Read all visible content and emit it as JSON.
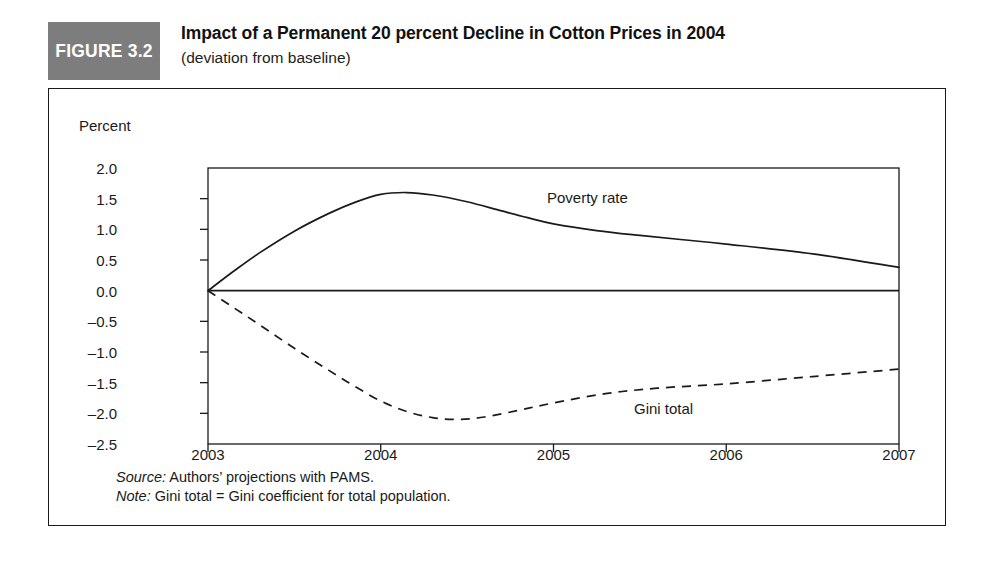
{
  "figure": {
    "badge": "FIGURE 3.2",
    "title": "Impact of a Permanent 20 percent Decline in Cotton Prices in 2004",
    "subtitle": "(deviation from baseline)"
  },
  "notes": {
    "source_label": "Source:",
    "source_text": " Authors’ projections with PAMS.",
    "note_label": "Note:",
    "note_text": " Gini total = Gini coefficient for total population."
  },
  "chart_data": {
    "type": "line",
    "title": "Impact of a Permanent 20 percent Decline in Cotton Prices in 2004",
    "subtitle": "(deviation from baseline)",
    "xlabel": "",
    "ylabel": "Percent",
    "ylim": [
      -2.5,
      2.0
    ],
    "xlim": [
      2003,
      2007
    ],
    "grid": false,
    "legend": "inline-annotations",
    "yticks": [
      "2.0",
      "1.5",
      "1.0",
      "0.5",
      "0.0",
      "–0.5",
      "–1.0",
      "–1.5",
      "–2.0",
      "–2.5"
    ],
    "ytick_values": [
      2.0,
      1.5,
      1.0,
      0.5,
      0.0,
      -0.5,
      -1.0,
      -1.5,
      -2.0,
      -2.5
    ],
    "xticks": [
      "2003",
      "2004",
      "2005",
      "2006",
      "2007"
    ],
    "xtick_values": [
      2003,
      2004,
      2005,
      2006,
      2007
    ],
    "zero_line": 0.0,
    "series": [
      {
        "name": "Poverty rate",
        "style": "solid",
        "color": "#1a1a1a",
        "x": [
          2003.0,
          2003.15,
          2003.3,
          2003.5,
          2003.7,
          2003.85,
          2004.0,
          2004.15,
          2004.3,
          2004.5,
          2004.7,
          2004.85,
          2005.0,
          2005.25,
          2005.5,
          2005.75,
          2006.0,
          2006.5,
          2007.0
        ],
        "y": [
          0.0,
          0.32,
          0.62,
          0.97,
          1.26,
          1.44,
          1.57,
          1.6,
          1.56,
          1.45,
          1.3,
          1.19,
          1.09,
          0.98,
          0.9,
          0.83,
          0.76,
          0.6,
          0.38
        ]
      },
      {
        "name": "Gini total",
        "style": "dashed",
        "color": "#1a1a1a",
        "x": [
          2003.0,
          2003.15,
          2003.3,
          2003.5,
          2003.7,
          2003.85,
          2004.0,
          2004.15,
          2004.3,
          2004.45,
          2004.6,
          2004.8,
          2005.0,
          2005.3,
          2005.6,
          2006.0,
          2006.5,
          2007.0
        ],
        "y": [
          0.0,
          -0.28,
          -0.56,
          -0.94,
          -1.3,
          -1.56,
          -1.8,
          -1.97,
          -2.07,
          -2.1,
          -2.06,
          -1.95,
          -1.83,
          -1.68,
          -1.59,
          -1.52,
          -1.4,
          -1.28
        ]
      }
    ],
    "annotations": [
      {
        "text": "Poverty rate",
        "x": 2004.9,
        "y": 1.18
      },
      {
        "text": "Gini total",
        "x": 2005.45,
        "y": -1.92
      }
    ]
  }
}
